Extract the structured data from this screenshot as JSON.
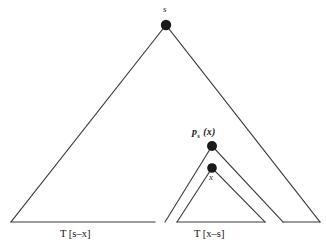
{
  "figure": {
    "type": "tree-triangle-diagram",
    "background_color": "#ffffff",
    "line_color": "#3a3a3a",
    "node_color": "#1a1a1a",
    "nodes": [
      {
        "id": "s",
        "label": "s",
        "x": 166,
        "y": 25,
        "radius": 5.2,
        "label_position": "above"
      },
      {
        "id": "ps_x",
        "label": "p",
        "label_sub": "s",
        "label_arg": " (x)",
        "x": 212,
        "y": 146,
        "radius": 5.0,
        "label_position": "above-left"
      },
      {
        "id": "x",
        "label": "x",
        "x": 212,
        "y": 168,
        "radius": 4.8,
        "label_position": "below"
      }
    ],
    "labels": {
      "apex": "s",
      "ps_main": "p",
      "ps_subscript": "s",
      "ps_argument": " (x)",
      "inner_apex": "x",
      "base_left": "T [s–x]",
      "base_right": "T [x–s]"
    },
    "triangles": [
      {
        "name": "outer-triangle",
        "apex": [
          166,
          25
        ],
        "left_foot": [
          11,
          222
        ],
        "right_foot": [
          320,
          222
        ],
        "base_segments": [
          [
            11,
            155
          ],
          [
            283,
            320
          ]
        ]
      },
      {
        "name": "middle-triangle",
        "apex": [
          212,
          146
        ],
        "left_foot": [
          165,
          222
        ],
        "right_foot": [
          283,
          222
        ],
        "base_segments": []
      },
      {
        "name": "inner-triangle",
        "apex": [
          212,
          168
        ],
        "left_foot": [
          177,
          222
        ],
        "right_foot": [
          265,
          222
        ],
        "base_segments": [
          [
            177,
            265
          ]
        ]
      }
    ],
    "baseline_y": 222
  }
}
